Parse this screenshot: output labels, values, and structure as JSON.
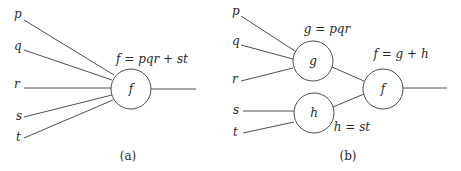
{
  "diagram_a": {
    "inputs": [
      "p",
      "q",
      "r",
      "s",
      "t"
    ],
    "node_label": "f",
    "equation": "f = pqr + st",
    "caption": "(a)"
  },
  "diagram_b": {
    "inputs": [
      "p",
      "q",
      "r",
      "s",
      "t"
    ],
    "node_g": {
      "label": "g",
      "equation": "g = pqr"
    },
    "node_h": {
      "label": "h",
      "equation": "h = st"
    },
    "node_f": {
      "label": "f",
      "equation": "f = g + h"
    },
    "caption": "(b)"
  },
  "colors": {
    "stroke": "#3a3a3a",
    "text": "#2a2a2a",
    "background": "#ffffff"
  }
}
